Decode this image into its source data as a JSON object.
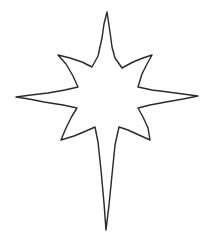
{
  "image": {
    "subject": "eight-pointed star outline",
    "style": "hand-drawn line art, black outline on white",
    "width": 215,
    "height": 241,
    "background_color": "#ffffff",
    "stroke_color": "#2b2b2b",
    "fill_color": "#ffffff",
    "stroke_width": 1.45,
    "point_count": 8
  },
  "shape": {
    "name": "star-outline",
    "type": "polygon",
    "center": {
      "x": 107,
      "y": 97
    },
    "tips": [
      {
        "name": "top",
        "x": 107,
        "y": 12
      },
      {
        "name": "upper-right",
        "x": 152,
        "y": 55
      },
      {
        "name": "right",
        "x": 198,
        "y": 96
      },
      {
        "name": "lower-right",
        "x": 150,
        "y": 140
      },
      {
        "name": "bottom",
        "x": 106,
        "y": 230
      },
      {
        "name": "lower-left",
        "x": 61,
        "y": 140
      },
      {
        "name": "left",
        "x": 16,
        "y": 97
      },
      {
        "name": "upper-left",
        "x": 58,
        "y": 55
      }
    ],
    "inner_vertices": [
      {
        "name": "top-right-inner",
        "x": 122,
        "y": 68
      },
      {
        "name": "right-top-inner",
        "x": 138,
        "y": 87
      },
      {
        "name": "right-bottom-inner",
        "x": 138,
        "y": 108
      },
      {
        "name": "bottom-right-inner",
        "x": 119,
        "y": 127
      },
      {
        "name": "bottom-left-inner",
        "x": 95,
        "y": 127
      },
      {
        "name": "left-bottom-inner",
        "x": 77,
        "y": 108
      },
      {
        "name": "left-top-inner",
        "x": 78,
        "y": 87
      },
      {
        "name": "top-left-inner",
        "x": 92,
        "y": 67
      }
    ],
    "path": "M 107 12 L 110 32 L 112 47 L 115 58 L 122 68 L 133 62 L 143 58 L 152 55 L 147 64 L 142 74 L 138 87 L 152 90 L 168 92 L 183 94 L 198 96 L 183 99 L 166 102 L 150 105 L 138 108 L 143 117 L 148 128 L 150 140 L 139 135 L 128 130 L 119 127 L 115 145 L 112 175 L 109 205 L 106 230 L 104 203 L 101 170 L 98 142 L 95 127 L 86 131 L 74 136 L 61 140 L 66 128 L 72 116 L 77 108 L 63 105 L 44 102 L 29 99 L 16 97 L 31 95 L 48 93 L 65 90 L 78 87 L 73 76 L 66 64 L 58 55 L 70 58 L 82 62 L 92 67 L 98 56 L 102 38 L 104 24 Z"
  }
}
